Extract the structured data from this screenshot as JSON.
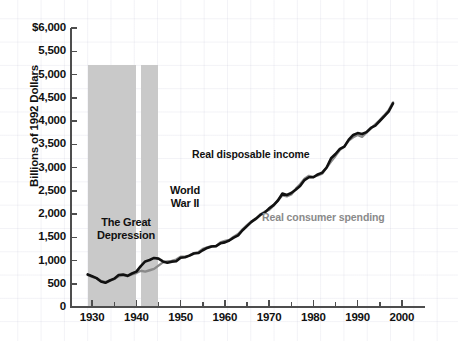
{
  "chart_data": {
    "type": "line",
    "title": "",
    "xlabel": "",
    "ylabel": "Billions of 1992 Dollars",
    "xlim": [
      1925,
      2005
    ],
    "ylim": [
      0,
      6000
    ],
    "grid": true,
    "legend_position": "inline-annotations",
    "y_ticks": [
      "$6,000",
      "5,500",
      "5,000",
      "4,500",
      "4,000",
      "3,500",
      "3,000",
      "2,500",
      "2,000",
      "1,500",
      "1,000",
      "500",
      "0"
    ],
    "y_tick_values": [
      6000,
      5500,
      5000,
      4500,
      4000,
      3500,
      3000,
      2500,
      2000,
      1500,
      1000,
      500,
      0
    ],
    "x_ticks": [
      "1930",
      "1940",
      "1950",
      "1960",
      "1970",
      "1980",
      "1990",
      "2000"
    ],
    "x_tick_values": [
      1930,
      1940,
      1950,
      1960,
      1970,
      1980,
      1990,
      2000
    ],
    "x_minor_tick_values": [
      1935,
      1945,
      1955,
      1965,
      1975,
      1985,
      1995
    ],
    "x": [
      1929,
      1930,
      1931,
      1932,
      1933,
      1934,
      1935,
      1936,
      1937,
      1938,
      1939,
      1940,
      1941,
      1942,
      1943,
      1944,
      1945,
      1946,
      1947,
      1948,
      1949,
      1950,
      1951,
      1952,
      1953,
      1954,
      1955,
      1956,
      1957,
      1958,
      1959,
      1960,
      1961,
      1962,
      1963,
      1964,
      1965,
      1966,
      1967,
      1968,
      1969,
      1970,
      1971,
      1972,
      1973,
      1974,
      1975,
      1976,
      1977,
      1978,
      1979,
      1980,
      1981,
      1982,
      1983,
      1984,
      1985,
      1986,
      1987,
      1988,
      1989,
      1990,
      1991,
      1992,
      1993,
      1994,
      1995,
      1996,
      1997,
      1998
    ],
    "series": [
      {
        "name": "Real disposable income",
        "color": "#111111",
        "values": [
          700,
          660,
          620,
          550,
          520,
          570,
          610,
          690,
          700,
          670,
          720,
          760,
          880,
          980,
          1010,
          1055,
          1040,
          980,
          950,
          975,
          985,
          1060,
          1070,
          1105,
          1150,
          1160,
          1220,
          1270,
          1300,
          1310,
          1370,
          1390,
          1430,
          1490,
          1540,
          1650,
          1740,
          1830,
          1900,
          1980,
          2030,
          2120,
          2190,
          2290,
          2440,
          2410,
          2450,
          2520,
          2600,
          2730,
          2790,
          2790,
          2850,
          2890,
          3000,
          3200,
          3290,
          3400,
          3450,
          3600,
          3700,
          3740,
          3720,
          3760,
          3850,
          3900,
          4000,
          4100,
          4200,
          4380
        ]
      },
      {
        "name": "Real consumer spending",
        "color": "#8a8a8a",
        "values": [
          690,
          650,
          620,
          560,
          540,
          565,
          600,
          660,
          680,
          665,
          700,
          730,
          780,
          760,
          790,
          820,
          890,
          960,
          980,
          990,
          1020,
          1080,
          1080,
          1110,
          1160,
          1180,
          1250,
          1280,
          1310,
          1310,
          1390,
          1420,
          1440,
          1510,
          1570,
          1670,
          1760,
          1840,
          1890,
          1990,
          2050,
          2090,
          2180,
          2300,
          2400,
          2380,
          2420,
          2540,
          2640,
          2760,
          2820,
          2800,
          2830,
          2870,
          3000,
          3130,
          3250,
          3380,
          3450,
          3580,
          3650,
          3700,
          3660,
          3750,
          3840,
          3930,
          4020,
          4120,
          4230,
          4400
        ]
      }
    ],
    "shaded_bands": [
      {
        "label": "The Great\nDepression",
        "start": 1929,
        "end": 1940,
        "top_value": 5200,
        "color": "#c9c9c9"
      },
      {
        "label": "World\nWar II",
        "start": 1941,
        "end": 1945,
        "top_value": 5200,
        "color": "#c9c9c9"
      }
    ],
    "annotations": [
      {
        "text": "Real disposable income",
        "color": "#111111"
      },
      {
        "text": "Real consumer spending",
        "color": "#8a8a8a"
      }
    ]
  }
}
